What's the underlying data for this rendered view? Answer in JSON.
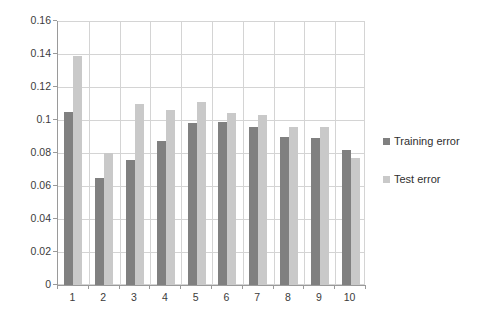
{
  "chart_data": {
    "type": "bar",
    "title": "",
    "subtitle": "",
    "xlabel": "",
    "ylabel": "",
    "categories": [
      "1",
      "2",
      "3",
      "4",
      "5",
      "6",
      "7",
      "8",
      "9",
      "10"
    ],
    "series": [
      {
        "name": "Training error",
        "color": "#808080",
        "values": [
          0.105,
          0.065,
          0.076,
          0.087,
          0.098,
          0.099,
          0.096,
          0.09,
          0.089,
          0.082
        ]
      },
      {
        "name": "Test error",
        "color": "#c9c9c9",
        "values": [
          0.139,
          0.08,
          0.11,
          0.106,
          0.111,
          0.104,
          0.103,
          0.096,
          0.096,
          0.077
        ]
      }
    ],
    "ylim": [
      0,
      0.16
    ],
    "y_ticks": [
      "0",
      "0.02",
      "0.04",
      "0.06",
      "0.08",
      "0.1",
      "0.12",
      "0.14",
      "0.16"
    ],
    "y_tick_values": [
      0,
      0.02,
      0.04,
      0.06,
      0.08,
      0.1,
      0.12,
      0.14,
      0.16
    ],
    "grid": true,
    "grid_horizontal": true,
    "grid_vertical": true,
    "legend_position": "right",
    "legend": [
      "Training error",
      "Test error"
    ],
    "background_color": "#ffffff",
    "axis_color": "#9a9a9a",
    "gridline_color": "#d4d4d4"
  }
}
